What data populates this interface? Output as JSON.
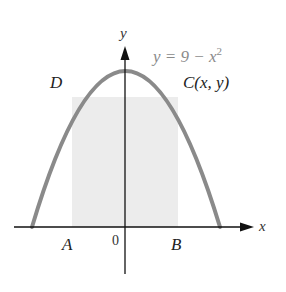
{
  "diagram": {
    "equation": "y = 9 − x",
    "equation_exponent": "2",
    "axes": {
      "x_label": "x",
      "y_label": "y",
      "origin_label": "0"
    },
    "points": {
      "D": "D",
      "C": "C(x, y)",
      "A": "A",
      "B": "B"
    },
    "colors": {
      "curve": "#8a8a8a",
      "rectangle_fill": "#ececec",
      "axes": "#111111",
      "equation_text": "#8a8a8a",
      "label_text": "#222222"
    }
  }
}
